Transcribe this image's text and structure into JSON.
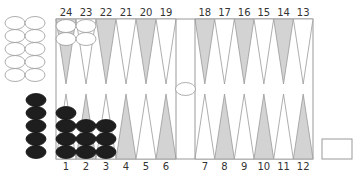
{
  "game": "backgammon",
  "colors": {
    "background": "#ffffff",
    "board_border": "#999999",
    "triangle_dark": "#d3d3d3",
    "triangle_light": "#ffffff",
    "triangle_stroke": "#999999",
    "checker_white_fill": "#ffffff",
    "checker_white_stroke": "#999999",
    "checker_black_fill": "#1e1e1e",
    "label": "#333333"
  },
  "top_labels": [
    "24",
    "23",
    "22",
    "21",
    "20",
    "19",
    "18",
    "17",
    "16",
    "15",
    "14",
    "13"
  ],
  "bottom_labels": [
    "1",
    "2",
    "3",
    "4",
    "5",
    "6",
    "7",
    "8",
    "9",
    "10",
    "11",
    "12"
  ],
  "points": [
    {
      "point": 24,
      "white": 2,
      "black": 0
    },
    {
      "point": 23,
      "white": 2,
      "black": 0
    },
    {
      "point": 1,
      "white": 0,
      "black": 4
    },
    {
      "point": 2,
      "white": 0,
      "black": 3
    },
    {
      "point": 3,
      "white": 0,
      "black": 3
    }
  ],
  "borne_off": {
    "white": 10,
    "black": 5
  },
  "bar": {
    "white": 1,
    "black": 0
  },
  "doubling_cube": {
    "value": ""
  }
}
